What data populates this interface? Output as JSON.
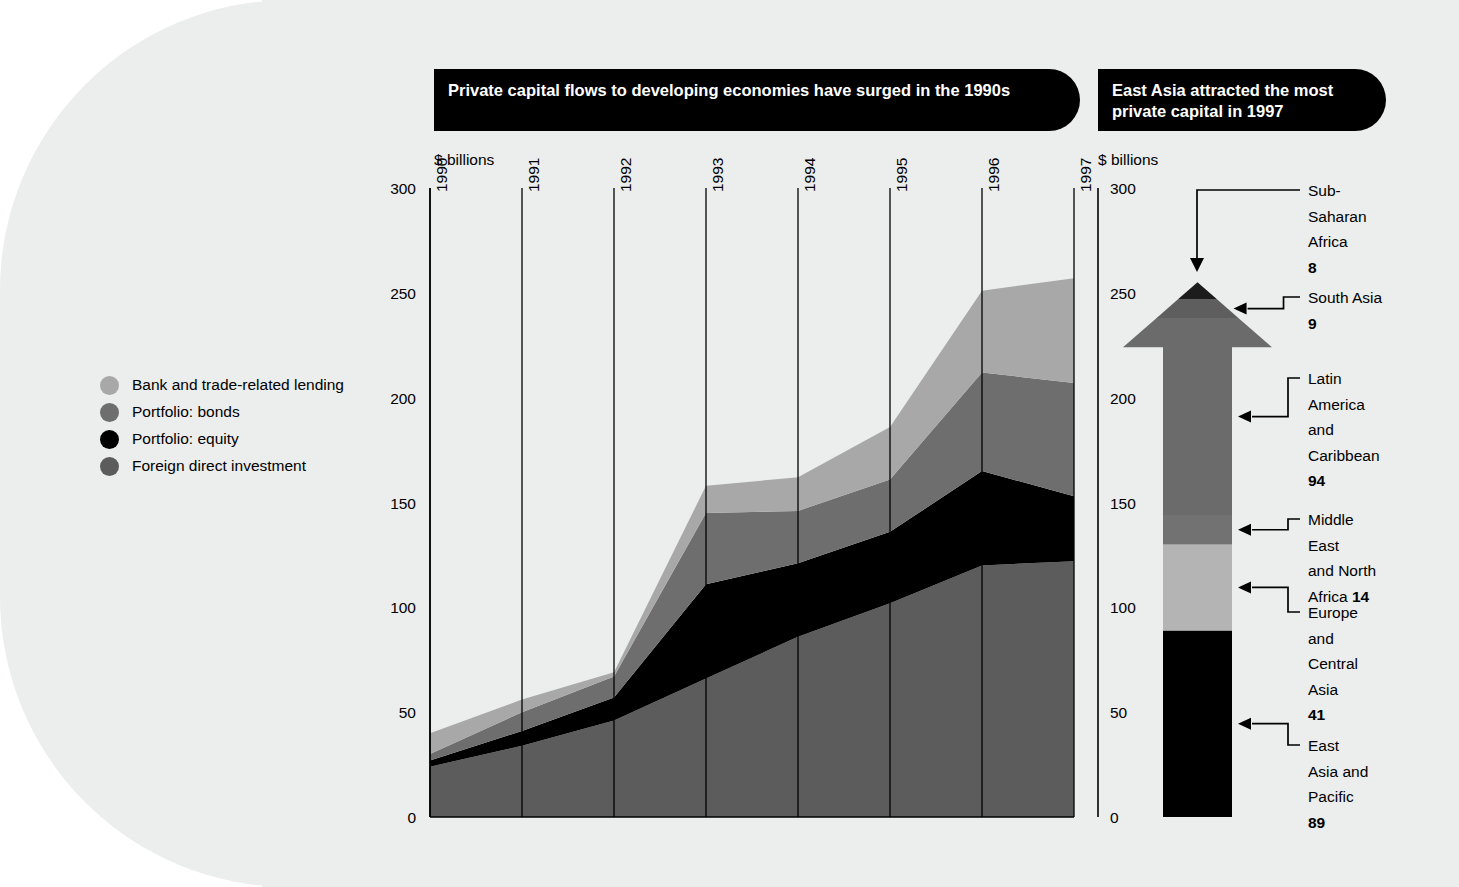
{
  "page": {
    "background_color": "#eceded",
    "panel_corner_radius_px": 290
  },
  "main_panel": {
    "banner_title": "Private capital flows to developing economies have surged in the 1990s",
    "axis_caption": "$ billions"
  },
  "side_panel": {
    "banner_title": "East Asia attracted the most private capital in 1997",
    "axis_caption": "$ billions"
  },
  "legend": {
    "items": [
      {
        "label": "Bank and trade-related lending",
        "color": "#a8a8a8",
        "key": "bank"
      },
      {
        "label": "Portfolio: bonds",
        "color": "#6e6e6e",
        "key": "bonds"
      },
      {
        "label": "Portfolio: equity",
        "color": "#000000",
        "key": "equity"
      },
      {
        "label": "Foreign direct investment",
        "color": "#5c5c5c",
        "key": "fdi"
      }
    ]
  },
  "chart_data": [
    {
      "id": "private-capital-flows-area",
      "type": "area",
      "stacked": true,
      "title": "Private capital flows to developing economies have surged in the 1990s",
      "xlabel": "",
      "ylabel": "$ billions",
      "ylim": [
        0,
        300
      ],
      "yticks": [
        0,
        50,
        100,
        150,
        200,
        250,
        300
      ],
      "ytick_labels": [
        "0",
        "50",
        "100",
        "150",
        "200",
        "250",
        "300"
      ],
      "grid": "vertical-year-lines",
      "legend_position": "left-outside",
      "categories": [
        "1990",
        "1991",
        "1992",
        "1993",
        "1994",
        "1995",
        "1996",
        "1997"
      ],
      "x": [
        1990,
        1991,
        1992,
        1993,
        1994,
        1995,
        1996,
        1997
      ],
      "series": [
        {
          "name": "Foreign direct investment",
          "color": "#5c5c5c",
          "values": [
            24,
            34,
            46,
            66,
            86,
            102,
            120,
            122
          ]
        },
        {
          "name": "Portfolio: equity",
          "color": "#000000",
          "values": [
            3,
            7,
            11,
            45,
            35,
            34,
            45,
            31
          ]
        },
        {
          "name": "Portfolio: bonds",
          "color": "#6e6e6e",
          "values": [
            3,
            9,
            10,
            34,
            25,
            25,
            47,
            54
          ]
        },
        {
          "name": "Bank and trade-related lending",
          "color": "#a8a8a8",
          "values": [
            10,
            6,
            2,
            13,
            16,
            25,
            39,
            50
          ]
        }
      ],
      "totals": [
        40,
        56,
        69,
        158,
        162,
        186,
        251,
        257
      ]
    },
    {
      "id": "east-asia-arrow-breakdown",
      "type": "bar",
      "stacked": true,
      "orientation": "vertical-arrow",
      "title": "East Asia attracted the most private capital in 1997",
      "ylabel": "$ billions",
      "ylim": [
        0,
        300
      ],
      "yticks": [
        0,
        50,
        100,
        150,
        200,
        250,
        300
      ],
      "ytick_labels": [
        "0",
        "50",
        "100",
        "150",
        "200",
        "250",
        "300"
      ],
      "categories": [
        "East Asia and Pacific",
        "Europe and Central Asia",
        "Middle East and North Africa",
        "Latin America and Caribbean",
        "South Asia",
        "Sub-Saharan Africa"
      ],
      "values": [
        89,
        41,
        14,
        94,
        9,
        8
      ],
      "segments": [
        {
          "label": "East Asia and\nPacific",
          "label_lines": [
            "East",
            "Asia and",
            "Pacific"
          ],
          "value": 89,
          "value_text": "89",
          "color": "#000000",
          "start": 0,
          "end": 89,
          "value_inline": false
        },
        {
          "label": "Europe and Central Asia",
          "label_lines": [
            "Europe",
            "and",
            "Central",
            "Asia"
          ],
          "value": 41,
          "value_text": "41",
          "color": "#b4b4b4",
          "start": 89,
          "end": 130,
          "value_inline": false
        },
        {
          "label": "Middle East and North Africa",
          "label_lines": [
            "Middle",
            "East",
            "and North",
            "Africa"
          ],
          "value": 14,
          "value_text": "14",
          "color": "#727272",
          "start": 130,
          "end": 144,
          "value_inline": true
        },
        {
          "label": "Latin America and Caribbean",
          "label_lines": [
            "Latin",
            "America",
            "and",
            "Caribbean"
          ],
          "value": 94,
          "value_text": "94",
          "color": "#6b6b6b",
          "start": 144,
          "end": 238,
          "value_inline": false
        },
        {
          "label": "South Asia",
          "label_lines": [
            "South Asia"
          ],
          "value": 9,
          "value_text": "9",
          "color": "#5e5e5e",
          "start": 238,
          "end": 247,
          "value_inline": false
        },
        {
          "label": "Sub-Saharan Africa",
          "label_lines": [
            "Sub-",
            "Saharan",
            "Africa"
          ],
          "value": 8,
          "value_text": "8",
          "color": "#1c1c1c",
          "start": 247,
          "end": 255,
          "value_inline": false
        }
      ],
      "total": 255
    }
  ]
}
